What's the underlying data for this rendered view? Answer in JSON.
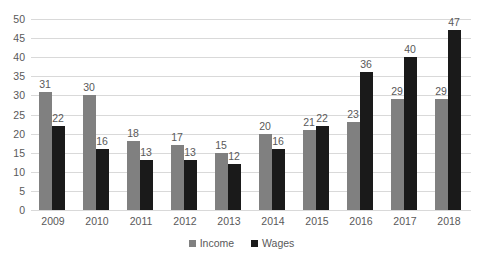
{
  "chart_data": {
    "type": "bar",
    "title": "",
    "subtitle": "",
    "xlabel": "",
    "ylabel": "",
    "categories": [
      "2009",
      "2010",
      "2011",
      "2012",
      "2013",
      "2014",
      "2015",
      "2016",
      "2017",
      "2018"
    ],
    "series": [
      {
        "name": "Income",
        "color": "#808080",
        "values": [
          31,
          30,
          18,
          17,
          15,
          20,
          21,
          23,
          29,
          29
        ]
      },
      {
        "name": "Wages",
        "color": "#1a1a1a",
        "values": [
          22,
          16,
          13,
          13,
          12,
          16,
          22,
          36,
          40,
          47
        ]
      }
    ],
    "ylim": [
      0,
      50
    ],
    "ytick_step": 5,
    "yticks": [
      "50",
      "45",
      "40",
      "35",
      "30",
      "25",
      "20",
      "15",
      "10",
      "5",
      "0"
    ],
    "grid": true,
    "grid_axis": "y",
    "grid_color": "#d9d9d9",
    "data_labels": true,
    "legend": {
      "position": "bottom",
      "entries": [
        "Income",
        "Wages"
      ]
    },
    "background": "#ffffff",
    "text_color": "#595959"
  }
}
